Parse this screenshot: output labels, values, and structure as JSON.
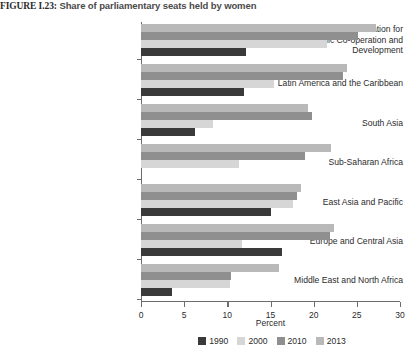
{
  "figure": {
    "number": "FIGURE I.23:",
    "title": "Share of parliamentary seats held by women"
  },
  "axis": {
    "xlabel": "Percent",
    "ticks": [
      "0",
      "5",
      "10",
      "15",
      "20",
      "25",
      "30"
    ]
  },
  "legend": {
    "items": [
      {
        "label": "1990",
        "color": "#3a3a3a"
      },
      {
        "label": "2000",
        "color": "#d6d6d6"
      },
      {
        "label": "2010",
        "color": "#8f8f8f"
      },
      {
        "label": "2013",
        "color": "#b9b9b9"
      }
    ]
  },
  "chart_data": {
    "type": "bar",
    "orientation": "horizontal",
    "title": "FIGURE I.23: Share of parliamentary seats held by women",
    "xlabel": "Percent",
    "ylabel": "",
    "xlim": [
      0,
      30
    ],
    "xticks": [
      0,
      5,
      10,
      15,
      20,
      25,
      30
    ],
    "grid": false,
    "legend_position": "bottom",
    "categories": [
      "High-income Organisation for Economic Co-operation and Development",
      "Latin America and the Caribbean",
      "South Asia",
      "Sub-Saharan Africa",
      "East Asia and Pacific",
      "Europe and Central Asia",
      "Middle East and North Africa"
    ],
    "series": [
      {
        "name": "1990",
        "color": "#3a3a3a",
        "values": [
          12.2,
          11.9,
          6.2,
          0.0,
          15.0,
          16.3,
          3.6
        ]
      },
      {
        "name": "2000",
        "color": "#d6d6d6",
        "values": [
          21.6,
          15.4,
          8.3,
          11.3,
          17.6,
          11.7,
          10.3
        ]
      },
      {
        "name": "2010",
        "color": "#8f8f8f",
        "values": [
          25.1,
          23.4,
          19.8,
          19.0,
          18.1,
          21.9,
          10.4
        ]
      },
      {
        "name": "2013",
        "color": "#b9b9b9",
        "values": [
          27.2,
          23.9,
          19.3,
          22.0,
          18.5,
          22.3,
          16.0
        ]
      }
    ]
  },
  "labels": {
    "cat0_line1": "High-income Organisation for",
    "cat0_line2": "Economic Co-operation and",
    "cat0_line3": "Development",
    "cat1": "Latin America and the Caribbean",
    "cat2": "South Asia",
    "cat3": "Sub-Saharan Africa",
    "cat4": "East Asia and Pacific",
    "cat5": "Europe and Central Asia",
    "cat6": "Middle East and North Africa"
  }
}
